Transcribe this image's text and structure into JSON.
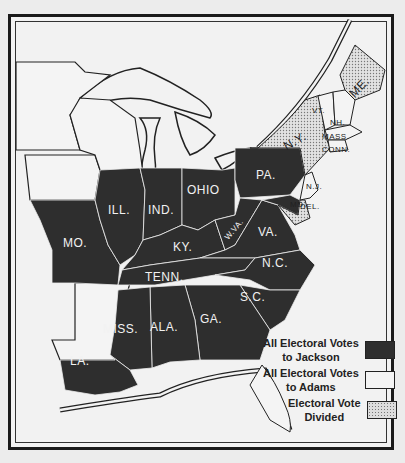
{
  "map": {
    "title": "",
    "colors": {
      "jackson": "#2e2e2e",
      "adams": "#f4f4f4",
      "divided": "#cfcfcf",
      "border": "#1a1a1a"
    },
    "states": {
      "mo": "MO.",
      "ill": "ILL.",
      "ind": "IND.",
      "ohio": "OHIO",
      "pa": "PA.",
      "ky": "KY.",
      "wva": "W.VA.",
      "va": "VA.",
      "tenn": "TENN.",
      "nc": "N.C.",
      "sc": "S.C.",
      "ga": "GA.",
      "ala": "ALA.",
      "miss": "MISS.",
      "la": "LA.",
      "ny": "N.Y.",
      "vt": "VT.",
      "nh": "NH.",
      "me": "ME.",
      "mass": "MASS.",
      "conn": "CONN.",
      "ri": "R.I.",
      "nj": "N.J.",
      "del": "DEL.",
      "md": "MD."
    }
  },
  "legend": {
    "items": [
      {
        "line1": "All Electoral Votes",
        "line2": "to Jackson",
        "key": "jackson"
      },
      {
        "line1": "All Electoral Votes",
        "line2": "to Adams",
        "key": "adams"
      },
      {
        "line1": "Electoral Vote",
        "line2": "Divided",
        "key": "divided"
      }
    ]
  }
}
